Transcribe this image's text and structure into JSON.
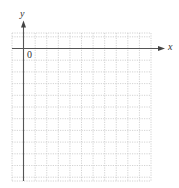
{
  "diagram": {
    "type": "coordinate-plane",
    "axes": {
      "x_label": "x",
      "y_label": "y",
      "origin_label": "0"
    },
    "grid": {
      "columns": 12,
      "rows_below_axis": 11,
      "rows_above_axis": 1,
      "line_style": "dotted",
      "line_color": "#c8c8c8"
    },
    "colors": {
      "axis": "#555555",
      "grid": "#c8c8c8",
      "background": "#ffffff"
    }
  }
}
